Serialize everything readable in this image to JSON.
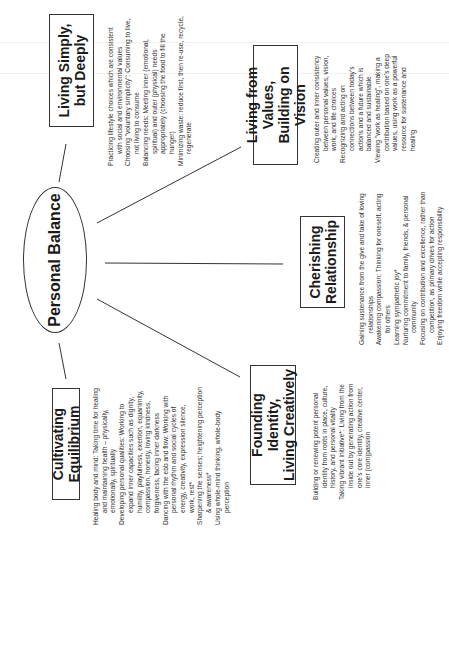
{
  "diagram": {
    "type": "mind-map",
    "orientation": "rotated -90deg (text reads bottom-to-top)",
    "center": {
      "label": "Personal Balance"
    },
    "branches": [
      {
        "id": "living-simply",
        "title_line1": "Living Simply,",
        "title_line2": "but Deeply",
        "items": [
          "Practicing lifestyle choices which are consistent with social and environmental values",
          "Choosing \"voluntary simplicity\": Consuming to live, not living to consume",
          "Balancing needs: Meeting inner (emotional, spiritual) and outer (physical) needs appropriately (choosing the food to fill the hunger)",
          "Minimizing waste: reduce first, then re-use, recycle, regenerate"
        ]
      },
      {
        "id": "living-from-values",
        "title_line1": "Living from Values,",
        "title_line2": "Building on Vision",
        "items": [
          "Creating outer and inner consistency between personal values, vision, work, and life choices",
          "Recognizing and acting on connections between today's actions and a future which is balanced and sustainable",
          "Viewing \"work as healing\", making a contribution based on one's deep values, using work as a powerful resource for sustenance and healing"
        ]
      },
      {
        "id": "cherishing-relationship",
        "title_line1": "Cherishing",
        "title_line2": "Relationship",
        "items": [
          "Gaining sustenance from the give and take of loving relationships",
          "Awakening compassion: Thinking for oneself, acting for others",
          "Learning sympathetic joy*",
          "Nurturing commitment to family, friends, & personal community",
          "Focusing on contribution and excellence, rather than competition, as primary drives for action",
          "Enjoying freedom while accepting responsibility"
        ]
      },
      {
        "id": "founding-identity",
        "title_line1": "Founding Identity,",
        "title_line2": "Living Creatively",
        "items": [
          "Building or renewing potent personal identity from roots in place, culture, history, and personal vitality",
          "Taking vibrant initiative*: Living from the inside out by generating action from one's core identity, creative center, inner (com)passion"
        ]
      },
      {
        "id": "cultivating-equilibrium",
        "title_line1": "Cultivating Equilibrium",
        "title_line2": "",
        "items": [
          "Healing body and mind: Taking time for healing and maintaining health – physically, emotionally, spiritually",
          "Developing personal qualities: Working to expand inner capacities such as dignity, humility, playfulness, exertion, equanimity, compassion, honesty, loving kindness, forgiveness, facing inner darkness",
          "Dancing with the ebb and flow: Working with personal rhythm and social cycles of energy, creativity, expression silence, work, rest*",
          "Sharpening the senses; heightening perception & awareness*",
          "Using whole-mind thinking, whole-body perception"
        ]
      }
    ],
    "colors": {
      "line": "#333333",
      "text": "#1a1a1a",
      "background": "#ffffff"
    }
  }
}
